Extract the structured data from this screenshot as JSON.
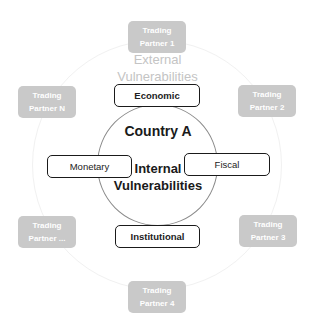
{
  "diagram": {
    "center": {
      "title": "Country A",
      "internal_label_line1": "Internal",
      "internal_label_line2": "Vulnerabilities"
    },
    "external_label_line1": "External",
    "external_label_line2": "Vulnerabilities",
    "policies": {
      "economic": "Economic",
      "monetary": "Monetary",
      "fiscal": "Fiscal",
      "institutional": "Institutional"
    },
    "partners": [
      {
        "line1": "Trading",
        "line2": "Partner 1"
      },
      {
        "line1": "Trading",
        "line2": "Partner 2"
      },
      {
        "line1": "Trading",
        "line2": "Partner 3"
      },
      {
        "line1": "Trading",
        "line2": "Partner 4"
      },
      {
        "line1": "Trading",
        "line2": "Partner ..."
      },
      {
        "line1": "Trading",
        "line2": "Partner N"
      }
    ],
    "colors": {
      "partner_fill": "#c9c9c9",
      "partner_text": "#ffffff",
      "external_label": "#c4c4c4",
      "policy_border": "#1a1a1a"
    }
  }
}
